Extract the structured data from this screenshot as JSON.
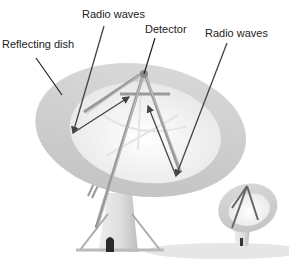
{
  "diagram": {
    "labels": {
      "reflecting_dish": "Reflecting dish",
      "radio_waves_left": "Radio waves",
      "detector": "Detector",
      "radio_waves_right": "Radio waves"
    },
    "colors": {
      "dish_rim": "#cfcfcf",
      "dish_inner": "#f2f2f2",
      "structure": "#9a9a9a",
      "arrow": "#444444",
      "ground": "#e6e6e6"
    }
  }
}
